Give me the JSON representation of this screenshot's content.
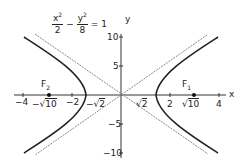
{
  "diagram": {
    "equation": {
      "x_num": "x",
      "x_exp": "2",
      "x_den": "2",
      "minus": "−",
      "y_num": "y",
      "y_exp": "2",
      "y_den": "8",
      "equals": "= 1"
    },
    "axes": {
      "x_label": "x",
      "y_label": "y",
      "x_ticks": [
        {
          "label": "−4",
          "value": -4
        },
        {
          "label": "−2",
          "value": -2
        },
        {
          "label": "2",
          "value": 2
        },
        {
          "label": "4",
          "value": 4
        }
      ],
      "y_ticks": [
        {
          "label": "10",
          "value": 10
        },
        {
          "label": "5",
          "value": 5
        },
        {
          "label": "−5",
          "value": -5
        },
        {
          "label": "−10",
          "value": -10
        }
      ],
      "x_special_labels": {
        "neg_sqrt10": {
          "prefix": "−√",
          "radicand": "10"
        },
        "neg_sqrt2": {
          "prefix": "−√",
          "radicand": "2"
        },
        "sqrt2": {
          "prefix": "√",
          "radicand": "2"
        },
        "sqrt10": {
          "prefix": "√",
          "radicand": "10"
        }
      }
    },
    "foci": [
      {
        "label": "F",
        "sub": "1",
        "x": 3.162,
        "y": 0
      },
      {
        "label": "F",
        "sub": "2",
        "x": -3.162,
        "y": 0
      }
    ],
    "curve": "x^2/2 - y^2/8 = 1",
    "asymptotes": [
      "y = 2x",
      "y = -2x"
    ],
    "colors": {
      "curve": "#222222",
      "asymptote": "#888888",
      "axis": "#333333"
    }
  }
}
